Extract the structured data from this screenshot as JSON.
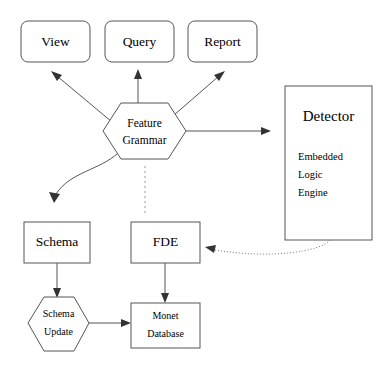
{
  "diagram": {
    "background_color": "#ffffff",
    "stroke_color": "#555555",
    "text_color": "#000000",
    "nodes": {
      "view": {
        "label": "View",
        "shape": "rounded-rectangle"
      },
      "query": {
        "label": "Query",
        "shape": "rounded-rectangle"
      },
      "report": {
        "label": "Report",
        "shape": "rounded-rectangle"
      },
      "feature_grammar": {
        "label_line1": "Feature",
        "label_line2": "Grammar",
        "shape": "hexagon"
      },
      "detector": {
        "title": "Detector",
        "line1": "Embedded",
        "line2": "Logic",
        "line3": "Engine",
        "shape": "rectangle"
      },
      "schema": {
        "label": "Schema",
        "shape": "rectangle"
      },
      "fde": {
        "label": "FDE",
        "shape": "rectangle"
      },
      "schema_update": {
        "label_line1": "Schema",
        "label_line2": "Update",
        "shape": "hexagon"
      },
      "monet_database": {
        "label_line1": "Monet",
        "label_line2": "Database",
        "shape": "rectangle"
      }
    },
    "edges": [
      {
        "name": "feature-grammar-to-view",
        "style": "solid",
        "arrow": true
      },
      {
        "name": "feature-grammar-to-query",
        "style": "solid",
        "arrow": true
      },
      {
        "name": "feature-grammar-to-report",
        "style": "solid",
        "arrow": true
      },
      {
        "name": "feature-grammar-to-detector",
        "style": "solid",
        "arrow": true
      },
      {
        "name": "feature-grammar-to-schema",
        "style": "solid-curved",
        "arrow": true
      },
      {
        "name": "feature-grammar-to-fde",
        "style": "dashed",
        "arrow": false
      },
      {
        "name": "schema-to-schema-update",
        "style": "solid",
        "arrow": true
      },
      {
        "name": "schema-update-to-monet-database",
        "style": "solid",
        "arrow": true
      },
      {
        "name": "fde-to-monet-database",
        "style": "solid",
        "arrow": true
      },
      {
        "name": "detector-to-fde",
        "style": "dotted-curved",
        "arrow": true
      }
    ]
  }
}
